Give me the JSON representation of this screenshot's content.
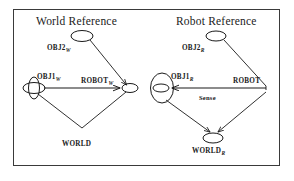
{
  "figure": {
    "width": 294,
    "height": 181,
    "background": "#ffffff",
    "border_color": "#3a3a3a",
    "ink_color": "#1a1a1a"
  },
  "panels": [
    {
      "id": "world-reference",
      "title": "World Reference",
      "title_x": 36,
      "title_y": 16,
      "nodes": [
        {
          "id": "obj2w",
          "label": "OBJ2",
          "subscript": "W",
          "label_x": 47,
          "label_y": 45,
          "shape": "ellipse",
          "cx": 82,
          "cy": 36,
          "rx": 11,
          "ry": 5.5,
          "tilt": 0
        },
        {
          "id": "obj1w",
          "label": "OBJ1",
          "subscript": "W",
          "label_x": 37,
          "label_y": 74,
          "shape": "crossed-ellipses",
          "cx": 34,
          "cy": 88,
          "rx": 11,
          "ry": 5.5,
          "tilt": 0
        },
        {
          "id": "robotw",
          "label": "ROBOT",
          "subscript": "W",
          "label_x": 81,
          "label_y": 78,
          "shape": "ellipse",
          "cx": 129,
          "cy": 88,
          "rx": 8,
          "ry": 4.5,
          "tilt": 0
        },
        {
          "id": "world",
          "label": "WORLD",
          "subscript": "",
          "label_x": 62,
          "label_y": 141,
          "shape": "none",
          "cx": 82,
          "cy": 128,
          "rx": 0,
          "ry": 0,
          "tilt": 0
        }
      ],
      "edges": [
        {
          "id": "obj2w-to-robotw",
          "from": "obj2w",
          "to": "robotw",
          "label": "",
          "arrow": "to"
        },
        {
          "id": "obj1w-to-robotw",
          "from": "obj1w",
          "to": "robotw",
          "label": "",
          "arrow": "to"
        },
        {
          "id": "obj1w-to-world",
          "from": "obj1w",
          "to": "world",
          "label": "",
          "arrow": "none"
        },
        {
          "id": "world-to-robotw",
          "from": "world",
          "to": "robotw",
          "label": "",
          "arrow": "none"
        }
      ]
    },
    {
      "id": "robot-reference",
      "title": "Robot Reference",
      "title_x": 176,
      "title_y": 16,
      "nodes": [
        {
          "id": "obj2r",
          "label": "OBJ2",
          "subscript": "R",
          "label_x": 182,
          "label_y": 45,
          "shape": "ellipse",
          "cx": 216,
          "cy": 36,
          "rx": 10,
          "ry": 5,
          "tilt": 0
        },
        {
          "id": "obj1r",
          "label": "OBJ1",
          "subscript": "R",
          "label_x": 171,
          "label_y": 74,
          "shape": "ellipse-vertical-inner",
          "cx": 162,
          "cy": 88,
          "rx": 11,
          "ry": 15,
          "tilt": 0
        },
        {
          "id": "robotr",
          "label": "ROBOT",
          "subscript": "",
          "label_x": 233,
          "label_y": 78,
          "shape": "none",
          "cx": 268,
          "cy": 88,
          "rx": 0,
          "ry": 0,
          "tilt": 0
        },
        {
          "id": "worldr",
          "label": "WORLD",
          "subscript": "R",
          "label_x": 192,
          "label_y": 148,
          "shape": "ellipse",
          "cx": 213,
          "cy": 138,
          "rx": 10,
          "ry": 5,
          "tilt": 0
        }
      ],
      "edges": [
        {
          "id": "obj2r-to-robotr",
          "from": "obj2r",
          "to": "robotr",
          "label": "",
          "arrow": "none"
        },
        {
          "id": "robotr-to-obj1r",
          "from": "robotr",
          "to": "obj1r",
          "label": "Sense",
          "arrow": "to",
          "label_x": 199,
          "label_y": 95
        },
        {
          "id": "obj1r-to-worldr",
          "from": "obj1r",
          "to": "worldr",
          "label": "",
          "arrow": "to"
        },
        {
          "id": "robotr-to-worldr",
          "from": "robotr",
          "to": "worldr",
          "label": "",
          "arrow": "to"
        }
      ]
    }
  ]
}
